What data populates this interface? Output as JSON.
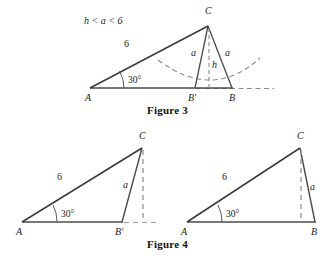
{
  "page": {
    "background_color": "#ffffff",
    "stroke_color": "#3a3a3a",
    "dash_color": "#777777",
    "text_color": "#1a1a1a"
  },
  "figure3": {
    "caption": "Figure 3",
    "condition_label": "h < a < 6",
    "angle_label": "30°",
    "vertices": {
      "a": "A",
      "b_prime": "B'",
      "b": "B",
      "c": "C"
    },
    "sides": {
      "hypotenuse": "6",
      "left_leg": "a",
      "right_leg": "a",
      "height": "h"
    },
    "geometry": {
      "a_point": [
        90,
        88
      ],
      "b_prime_point": [
        195,
        88
      ],
      "b_point": [
        232,
        88
      ],
      "c_point": [
        208,
        25
      ],
      "baseline_dash_end": [
        272,
        88
      ],
      "arc_left_end": [
        158,
        62
      ],
      "arc_bottom": [
        213,
        94
      ],
      "arc_right_end": [
        260,
        60
      ]
    }
  },
  "figure4": {
    "caption": "Figure 4",
    "left_triangle": {
      "angle_label": "30°",
      "vertices": {
        "a": "A",
        "b_prime": "B'",
        "c": "C"
      },
      "sides": {
        "hypotenuse": "6",
        "leg": "a"
      },
      "geometry": {
        "a_point": [
          22,
          222
        ],
        "b_prime_point": [
          122,
          222
        ],
        "c_point": [
          142,
          148
        ],
        "foot_point": [
          142,
          222
        ],
        "baseline_dash_end": [
          158,
          222
        ]
      }
    },
    "right_triangle": {
      "angle_label": "30°",
      "vertices": {
        "a": "A",
        "b": "B",
        "c": "C"
      },
      "sides": {
        "hypotenuse": "6",
        "leg": "a"
      },
      "geometry": {
        "a_point": [
          187,
          222
        ],
        "b_point": [
          315,
          222
        ],
        "c_point": [
          300,
          148
        ],
        "foot_point": [
          300,
          222
        ]
      }
    }
  }
}
